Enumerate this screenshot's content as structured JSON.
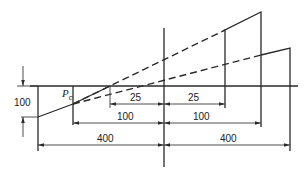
{
  "diagram": {
    "point_label": {
      "main": "P",
      "subscript": "c"
    },
    "vertical_dimension": {
      "label": "100"
    },
    "left_dimensions": [
      {
        "label": "25"
      },
      {
        "label": "100"
      },
      {
        "label": "400"
      }
    ],
    "right_dimensions": [
      {
        "label": "25"
      },
      {
        "label": "100"
      },
      {
        "label": "400"
      }
    ],
    "line_color": "#2a2a2a"
  }
}
